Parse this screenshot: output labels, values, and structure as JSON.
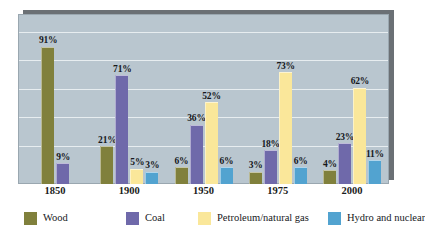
{
  "chart_data": {
    "type": "bar",
    "title": "",
    "subtitle": "",
    "xlabel": "",
    "ylabel": "",
    "ylim": [
      0,
      100
    ],
    "grid": true,
    "gridlines": [
      0,
      20,
      40,
      60,
      80,
      100
    ],
    "legend_position": "bottom",
    "categories": [
      "1850",
      "1900",
      "1950",
      "1975",
      "2000"
    ],
    "series": [
      {
        "name": "Wood",
        "color": "#80803c",
        "values": [
          91,
          21,
          6,
          3,
          4
        ],
        "labels": [
          "91%",
          "21%",
          "6%",
          "3%",
          "4%"
        ]
      },
      {
        "name": "Coal",
        "color": "#6f69aa",
        "values": [
          9,
          71,
          36,
          18,
          23
        ],
        "labels": [
          "9%",
          "71%",
          "36%",
          "18%",
          "23%"
        ]
      },
      {
        "name": "Petroleum/natural gas",
        "color": "#fae79a",
        "values": [
          null,
          5,
          52,
          73,
          62
        ],
        "labels": [
          "",
          "5%",
          "52%",
          "73%",
          "62%"
        ]
      },
      {
        "name": "Hydro and nuclear",
        "color": "#52a3d0",
        "values": [
          null,
          3,
          6,
          6,
          11
        ],
        "labels": [
          "",
          "3%",
          "6%",
          "6%",
          "11%"
        ]
      }
    ],
    "colors": {
      "plot_background": "#b9c6cf",
      "gridline": "#eef3f6",
      "shadow": "#6b7075",
      "page_background": "#ffffff",
      "text": "#16181c"
    }
  },
  "legend": {
    "items": [
      {
        "label": "Wood",
        "color": "#80803c"
      },
      {
        "label": "Coal",
        "color": "#6f69aa"
      },
      {
        "label": "Petroleum/natural gas",
        "color": "#fae79a"
      },
      {
        "label": "Hydro and nuclear",
        "color": "#52a3d0"
      }
    ]
  },
  "axis": {
    "x_ticks": [
      "1850",
      "1900",
      "1950",
      "1975",
      "2000"
    ]
  }
}
